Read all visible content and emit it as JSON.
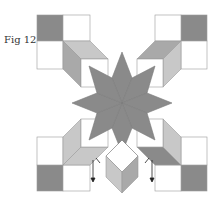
{
  "figure": {
    "caption": "Fig 12"
  },
  "colors": {
    "dark": "#8a8a8a",
    "medium": "#a9a9a9",
    "light": "#c8c8c8",
    "white": "#ffffff",
    "outline": "#9a9a9a",
    "arrow": "#222222"
  }
}
